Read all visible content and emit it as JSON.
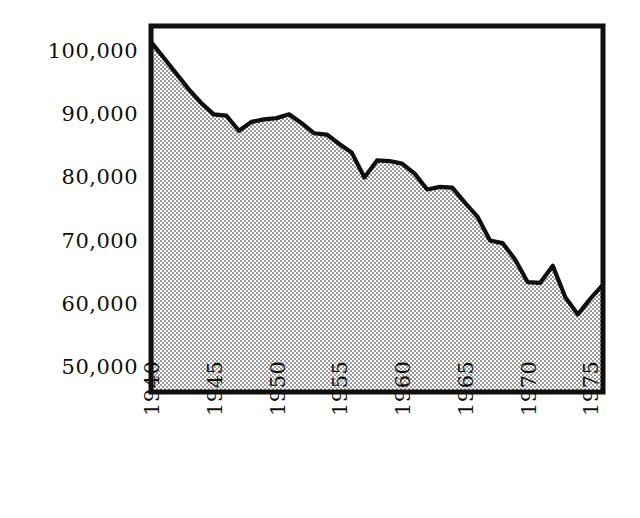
{
  "chart_data": {
    "type": "area",
    "title": "",
    "subtitle": "",
    "xlabel": "",
    "ylabel": "",
    "xlim": [
      1940,
      1976
    ],
    "ylim": [
      46000,
      104000
    ],
    "grid": false,
    "legend": null,
    "xticks": [
      1940,
      1945,
      1950,
      1955,
      1960,
      1965,
      1970,
      1975
    ],
    "xtick_labels": [
      "1940",
      "1945",
      "1950",
      "1955",
      "1960",
      "1965",
      "1970",
      "1975"
    ],
    "xtick_rotation": 90,
    "yticks": [
      50000,
      60000,
      70000,
      80000,
      90000,
      100000
    ],
    "ytick_labels": [
      "50,000",
      "60,000",
      "70,000",
      "80,000",
      "90,000",
      "100,000"
    ],
    "fill_color": "#b4b4b4",
    "fill_pattern": "checker-dither",
    "line_color": "#100f0d",
    "frame_color": "#100f0d",
    "baseline_value": 46000,
    "x": [
      1940,
      1941,
      1942,
      1943,
      1944,
      1945,
      1946,
      1947,
      1948,
      1949,
      1950,
      1951,
      1952,
      1953,
      1954,
      1955,
      1956,
      1957,
      1958,
      1959,
      1960,
      1961,
      1962,
      1963,
      1964,
      1965,
      1966,
      1967,
      1968,
      1969,
      1970,
      1971,
      1972,
      1973,
      1974,
      1975,
      1976
    ],
    "values": [
      101500,
      99000,
      96500,
      94000,
      91800,
      90000,
      89800,
      87400,
      88800,
      89200,
      89400,
      90000,
      88600,
      87000,
      86800,
      85300,
      83900,
      80000,
      82700,
      82600,
      82200,
      80600,
      78100,
      78500,
      78400,
      76000,
      73800,
      70000,
      69600,
      67000,
      63400,
      63300,
      66000,
      61000,
      58300,
      60800,
      63000
    ],
    "series": [
      {
        "name": "value",
        "values": [
          101500,
          99000,
          96500,
          94000,
          91800,
          90000,
          89800,
          87400,
          88800,
          89200,
          89400,
          90000,
          88600,
          87000,
          86800,
          85300,
          83900,
          80000,
          82700,
          82600,
          82200,
          80600,
          78100,
          78500,
          78400,
          76000,
          73800,
          70000,
          69600,
          67000,
          63400,
          63300,
          66000,
          61000,
          58300,
          60800,
          63000
        ]
      }
    ]
  }
}
